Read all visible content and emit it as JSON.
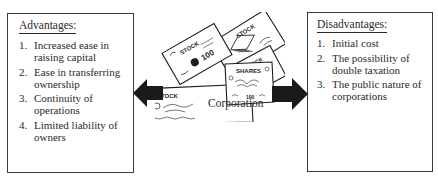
{
  "diagram": {
    "center": {
      "label": "Corporation",
      "certificate_labels": [
        "STOCK",
        "STOCK",
        "STOCK",
        "SHARES",
        "STOCK"
      ],
      "certificate_values": [
        "100",
        "100"
      ]
    },
    "advantages": {
      "heading": "Advantages:",
      "items": [
        {
          "num": "1.",
          "lines": [
            "Increased ease in",
            "raising capital"
          ]
        },
        {
          "num": "2.",
          "lines": [
            "Ease in transferring",
            "ownership"
          ]
        },
        {
          "num": "3.",
          "lines": [
            "Continuity of",
            "operations"
          ]
        },
        {
          "num": "4.",
          "lines": [
            "Limited liability of",
            "owners"
          ]
        }
      ]
    },
    "disadvantages": {
      "heading": "Disadvantages:",
      "items": [
        {
          "num": "1.",
          "lines": [
            "Initial cost"
          ]
        },
        {
          "num": "2.",
          "lines": [
            "The possibility of",
            "double taxation"
          ]
        },
        {
          "num": "3.",
          "lines": [
            "The public nature of",
            "corporations"
          ]
        }
      ]
    },
    "colors": {
      "ink": "#2a2a2a",
      "arrow": "#1a1a1a",
      "background": "#ffffff"
    }
  }
}
